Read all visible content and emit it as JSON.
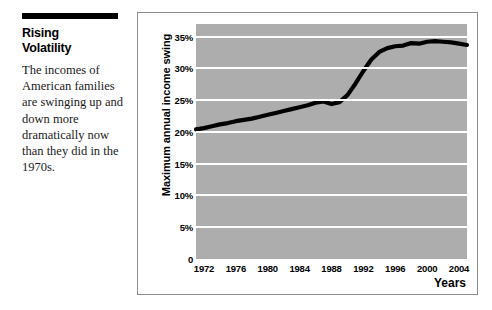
{
  "article": {
    "headline_line1": "Rising",
    "headline_line2": "Volatility",
    "body": "The incomes of American families are swinging up and down more dramatically now than they did in the 1970s."
  },
  "chart_data": {
    "type": "line",
    "title": "",
    "xlabel": "Years",
    "ylabel": "Maximum annual income swing",
    "xlim": [
      1971,
      2005
    ],
    "ylim": [
      0,
      37
    ],
    "grid": true,
    "legend": "none",
    "plot_background": "#adadad",
    "line_color": "#000000",
    "gridline_color": "#ffffff",
    "xticks": [
      1972,
      1976,
      1980,
      1984,
      1988,
      1992,
      1996,
      2000,
      2004
    ],
    "xtick_labels": [
      "1972",
      "1976",
      "1980",
      "1984",
      "1988",
      "1992",
      "1996",
      "2000",
      "2004"
    ],
    "yticks": [
      0,
      5,
      10,
      15,
      20,
      25,
      30,
      35
    ],
    "ytick_labels": [
      "0",
      "5%",
      "10%",
      "15%",
      "20%",
      "25%",
      "30%",
      "35%"
    ],
    "series": [
      {
        "name": "Maximum annual income swing",
        "x": [
          1971,
          1972,
          1973,
          1974,
          1975,
          1976,
          1977,
          1978,
          1979,
          1980,
          1981,
          1982,
          1983,
          1984,
          1985,
          1986,
          1987,
          1988,
          1989,
          1990,
          1991,
          1992,
          1993,
          1994,
          1995,
          1996,
          1997,
          1998,
          1999,
          2000,
          2001,
          2002,
          2003,
          2004,
          2005
        ],
        "values": [
          20.4,
          20.6,
          20.9,
          21.2,
          21.4,
          21.7,
          21.9,
          22.1,
          22.4,
          22.7,
          23.0,
          23.3,
          23.6,
          23.9,
          24.2,
          24.6,
          24.8,
          24.4,
          24.7,
          25.8,
          27.6,
          29.6,
          31.4,
          32.6,
          33.2,
          33.5,
          33.6,
          34.0,
          33.9,
          34.2,
          34.3,
          34.2,
          34.1,
          33.9,
          33.7
        ]
      }
    ]
  }
}
